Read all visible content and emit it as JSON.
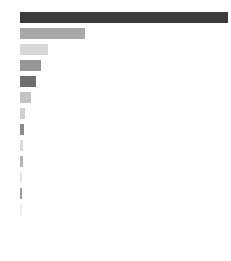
{
  "chart_data": {
    "type": "bar",
    "orientation": "horizontal",
    "title": "",
    "subtitle": "",
    "xlabel": "",
    "ylabel": "",
    "grid": false,
    "legend_position": "none",
    "background_color": "#ffffff",
    "axis_visible": false,
    "tick_labels_visible": false,
    "xlim": [
      0,
      208
    ],
    "categories": [
      "1",
      "2",
      "3",
      "4",
      "5",
      "6",
      "7",
      "8",
      "9",
      "10",
      "11",
      "12",
      "13"
    ],
    "values": [
      208,
      65,
      28,
      21,
      16,
      11,
      5,
      4,
      3,
      3,
      2,
      2,
      2
    ],
    "colors": [
      "#3a3a3c",
      "#a8a8aa",
      "#d8d8da",
      "#969698",
      "#6e6e70",
      "#c4c4c6",
      "#d0d0d2",
      "#8a8a8c",
      "#dcdcde",
      "#b4b4b6",
      "#e4e4e6",
      "#9a9a9c",
      "#ededef"
    ],
    "series": [
      {
        "name": "values",
        "values": [
          208,
          65,
          28,
          21,
          16,
          11,
          5,
          4,
          3,
          3,
          2,
          2,
          2
        ]
      }
    ],
    "geometry": {
      "plot_left_px": 20,
      "plot_top_px": 12,
      "bar_height_px": 11,
      "bar_gap_px": 5,
      "canvas_width_px": 231,
      "canvas_height_px": 261
    }
  }
}
